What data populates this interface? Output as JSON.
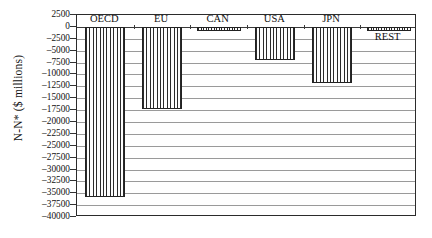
{
  "chart_data": {
    "type": "bar",
    "title": "",
    "xlabel": "",
    "ylabel": "N-N* ($ millions)",
    "categories": [
      "OECD",
      "EU",
      "CAN",
      "USA",
      "JPN",
      "REST"
    ],
    "values": [
      -35800,
      -17300,
      -700,
      -7000,
      -11800,
      -700
    ],
    "ylim": [
      -40000,
      2500
    ],
    "yticks": [
      2500,
      0,
      -2500,
      -5000,
      -7500,
      -10000,
      -12500,
      -15000,
      -17500,
      -20000,
      -22500,
      -25000,
      -27500,
      -30000,
      -32500,
      -35000,
      -37500,
      -40000
    ],
    "ytick_labels": [
      "2500",
      "0",
      "-2500",
      "-5000",
      "-7500",
      "-10000",
      "-12500",
      "-15000",
      "-17500",
      "-20000",
      "-22500",
      "-25000",
      "-27500",
      "-30000",
      "-32500",
      "-35000",
      "-37500",
      "-40000"
    ],
    "grid": true,
    "legend": "none",
    "bar_fill": "vertical-hatch",
    "label_positions": [
      "above",
      "above",
      "above",
      "above",
      "above",
      "below"
    ],
    "colors": {
      "bar_edge": "#222222",
      "bar_hatch": "#2a2a2a",
      "gridline": "#9a9a9a",
      "axis": "#2b2b2b",
      "background": "#ffffff",
      "text": "#111111"
    }
  }
}
